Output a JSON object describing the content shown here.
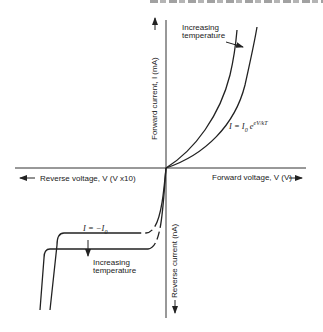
{
  "figure": {
    "axes": {
      "forward_voltage_label": "Forward voltage, V (V)",
      "reverse_voltage_label": "Reverse voltage, V (V x10)",
      "forward_current_label": "Forward current, I (mA)",
      "reverse_current_label": "Reverse current (nA)"
    },
    "annotations": {
      "forward_temp_line1": "Increasing",
      "forward_temp_line2": "temperature",
      "reverse_temp_line1": "Increasing",
      "reverse_temp_line2": "temperature",
      "forward_equation_main": "I = I",
      "forward_equation_sub": "0",
      "forward_equation_exp_base": " e",
      "forward_equation_exp": "eV/kT",
      "reverse_equation_main": "I = −I",
      "reverse_equation_sub": "0"
    },
    "curves": {
      "forward": [
        "lower temperature",
        "higher temperature"
      ],
      "reverse": [
        "lower temperature",
        "higher temperature"
      ]
    },
    "colors": {
      "ink": "#222222",
      "background": "#ffffff"
    }
  }
}
